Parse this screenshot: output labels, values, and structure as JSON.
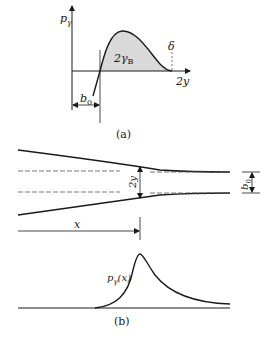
{
  "figure_a": {
    "caption": "(a)",
    "y_axis_label": "p",
    "y_axis_sub": "γ",
    "x_axis_label": "2y",
    "area_label": "2γ",
    "area_label_sub": "B",
    "delta_label": "δ",
    "b0_label": "b",
    "b0_sub": "0"
  },
  "figure_b": {
    "caption": "(b)",
    "gap_label": "2y",
    "b0_label": "b",
    "b0_sub": "0",
    "x_label": "x",
    "curve_label": "p",
    "curve_label_sub": "γ",
    "curve_label_arg": "(x)"
  },
  "colors": {
    "line": "#1a1a1a",
    "fill": "#d9d9d9",
    "dash": "#555555"
  }
}
